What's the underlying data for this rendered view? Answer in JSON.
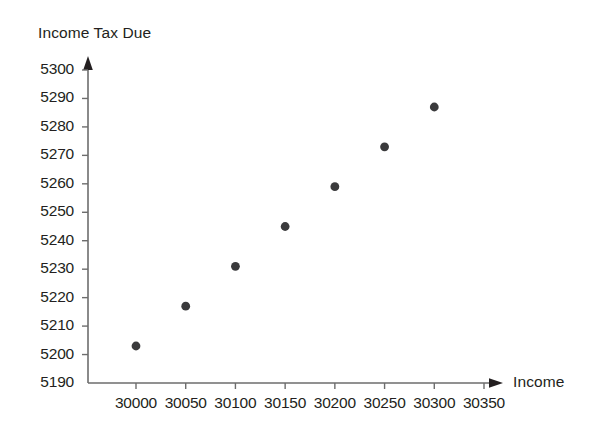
{
  "chart_data": {
    "type": "scatter",
    "title": "",
    "ylabel": "Income Tax Due",
    "xlabel": "Income",
    "x": [
      30000,
      30050,
      30100,
      30150,
      30200,
      30250,
      30300
    ],
    "values": [
      5203,
      5217,
      5231,
      5245,
      5259,
      5273,
      5287
    ],
    "points": [
      {
        "x": 30000,
        "y": 5203
      },
      {
        "x": 30050,
        "y": 5217
      },
      {
        "x": 30100,
        "y": 5231
      },
      {
        "x": 30150,
        "y": 5245
      },
      {
        "x": 30200,
        "y": 5259
      },
      {
        "x": 30250,
        "y": 5273
      },
      {
        "x": 30300,
        "y": 5287
      }
    ],
    "xticks": [
      30000,
      30050,
      30100,
      30150,
      30200,
      30250,
      30300,
      30350
    ],
    "xtick_labels": [
      "30000",
      "30050",
      "30100",
      "30150",
      "30200",
      "30250",
      "30300",
      "30350"
    ],
    "yticks": [
      5190,
      5200,
      5210,
      5220,
      5230,
      5240,
      5250,
      5260,
      5270,
      5280,
      5290,
      5300
    ],
    "ytick_labels": [
      "5190",
      "5200",
      "5210",
      "5220",
      "5230",
      "5240",
      "5250",
      "5260",
      "5270",
      "5280",
      "5290",
      "5300"
    ],
    "xlim": [
      29975,
      30375
    ],
    "ylim": [
      5190,
      5305
    ],
    "grid": false,
    "legend": null,
    "marker_color": "#3a3a3c",
    "axis_color": "#6d6d6d",
    "text_color": "#231f20"
  },
  "axes": {
    "y_axis_title": "Income Tax Due",
    "x_axis_title": "Income"
  }
}
